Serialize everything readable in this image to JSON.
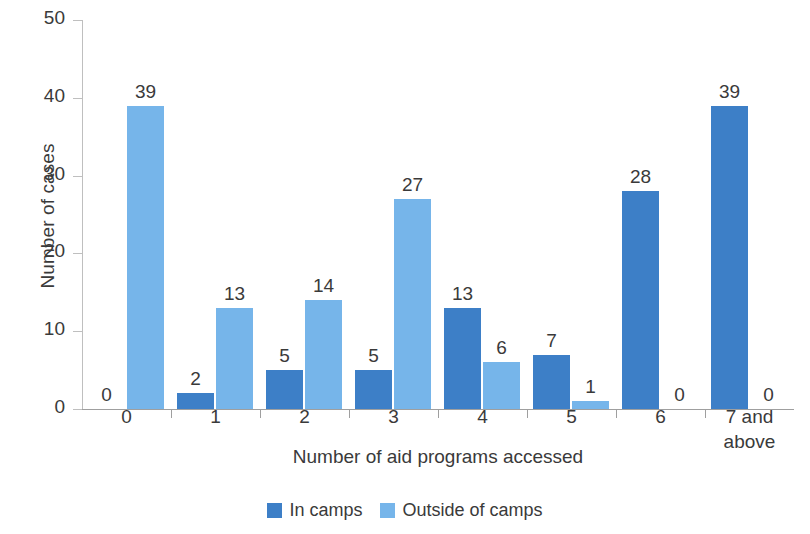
{
  "chart_data": {
    "type": "bar",
    "title": "",
    "xlabel": "Number of aid programs accessed",
    "ylabel": "Number of cases",
    "categories": [
      "0",
      "1",
      "2",
      "3",
      "4",
      "5",
      "6",
      "7 and above"
    ],
    "series": [
      {
        "name": "In camps",
        "color": "#3d7fc7",
        "values": [
          0,
          2,
          5,
          5,
          13,
          7,
          28,
          39
        ]
      },
      {
        "name": "Outside of camps",
        "color": "#76b5ea",
        "values": [
          39,
          13,
          14,
          27,
          6,
          1,
          0,
          0
        ]
      }
    ],
    "ylim": [
      0,
      50
    ],
    "yticks": [
      0,
      10,
      20,
      30,
      40,
      50
    ],
    "ytick_labels": [
      "0",
      "10",
      "20",
      "30",
      "40",
      "50"
    ],
    "grid": false,
    "legend_position": "bottom",
    "data_labels": true
  },
  "axes": {
    "y_title": "Number of cases",
    "x_title": "Number of aid programs accessed",
    "y_tick_labels": [
      "50",
      "40",
      "30",
      "20",
      "10",
      "0"
    ],
    "x_tick_labels": [
      "0",
      "1",
      "2",
      "3",
      "4",
      "5",
      "6",
      "7 and above"
    ]
  },
  "bar_labels": {
    "g0": {
      "in_camps": "0",
      "outside": "39"
    },
    "g1": {
      "in_camps": "2",
      "outside": "13"
    },
    "g2": {
      "in_camps": "5",
      "outside": "14"
    },
    "g3": {
      "in_camps": "5",
      "outside": "27"
    },
    "g4": {
      "in_camps": "13",
      "outside": "6"
    },
    "g5": {
      "in_camps": "7",
      "outside": "1"
    },
    "g6": {
      "in_camps": "28",
      "outside": "0"
    },
    "g7": {
      "in_camps": "39",
      "outside": "0"
    }
  },
  "legend": {
    "items": [
      {
        "label": "In camps",
        "color": "#3d7fc7"
      },
      {
        "label": "Outside of camps",
        "color": "#76b5ea"
      }
    ]
  },
  "colors": {
    "in_camps": "#3d7fc7",
    "outside_of_camps": "#76b5ea",
    "axis": "#9f9f9f",
    "text": "#3a3a3a",
    "background": "#ffffff"
  }
}
